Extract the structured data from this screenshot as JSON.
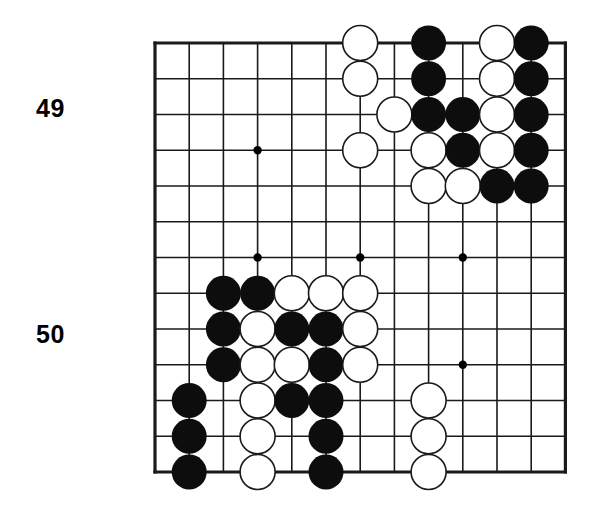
{
  "page": {
    "background_color": "#ffffff",
    "width": 600,
    "height": 515
  },
  "labels": [
    {
      "name": "row-label-49",
      "text": "49",
      "x": 36,
      "y": 96
    },
    {
      "name": "row-label-50",
      "text": "50",
      "x": 36,
      "y": 322
    }
  ],
  "board": {
    "name": "go-board",
    "origin_x": 155,
    "origin_y": 43,
    "cols": 13,
    "rows": 13,
    "col_spacing": 34.2,
    "row_spacing": 35.75,
    "line_color": "#1a1a1a",
    "line_width": 1.6,
    "border_width": 3.2,
    "star_color": "#000000",
    "star_radius": 4.2,
    "star_points": [
      {
        "col": 3,
        "row": 3
      },
      {
        "col": 3,
        "row": 6
      },
      {
        "col": 6,
        "row": 6
      },
      {
        "col": 9,
        "row": 6
      },
      {
        "col": 9,
        "row": 9
      }
    ],
    "stone_radius": 17.5,
    "black_color": "#0d0d0d",
    "white_color": "#ffffff",
    "white_edge_color": "#1a1a1a",
    "white_edge_width": 1.6,
    "stones": [
      {
        "col": 6,
        "row": 0,
        "color": "white"
      },
      {
        "col": 8,
        "row": 0,
        "color": "black"
      },
      {
        "col": 10,
        "row": 0,
        "color": "white"
      },
      {
        "col": 11,
        "row": 0,
        "color": "black"
      },
      {
        "col": 6,
        "row": 1,
        "color": "white"
      },
      {
        "col": 8,
        "row": 1,
        "color": "black"
      },
      {
        "col": 10,
        "row": 1,
        "color": "white"
      },
      {
        "col": 11,
        "row": 1,
        "color": "black"
      },
      {
        "col": 7,
        "row": 2,
        "color": "white"
      },
      {
        "col": 8,
        "row": 2,
        "color": "black"
      },
      {
        "col": 9,
        "row": 2,
        "color": "black"
      },
      {
        "col": 10,
        "row": 2,
        "color": "white"
      },
      {
        "col": 11,
        "row": 2,
        "color": "black"
      },
      {
        "col": 6,
        "row": 3,
        "color": "white"
      },
      {
        "col": 8,
        "row": 3,
        "color": "white"
      },
      {
        "col": 9,
        "row": 3,
        "color": "black"
      },
      {
        "col": 10,
        "row": 3,
        "color": "white"
      },
      {
        "col": 11,
        "row": 3,
        "color": "black"
      },
      {
        "col": 8,
        "row": 4,
        "color": "white"
      },
      {
        "col": 9,
        "row": 4,
        "color": "white"
      },
      {
        "col": 10,
        "row": 4,
        "color": "black"
      },
      {
        "col": 11,
        "row": 4,
        "color": "black"
      },
      {
        "col": 2,
        "row": 7,
        "color": "black"
      },
      {
        "col": 3,
        "row": 7,
        "color": "black"
      },
      {
        "col": 4,
        "row": 7,
        "color": "white"
      },
      {
        "col": 5,
        "row": 7,
        "color": "white"
      },
      {
        "col": 6,
        "row": 7,
        "color": "white"
      },
      {
        "col": 2,
        "row": 8,
        "color": "black"
      },
      {
        "col": 3,
        "row": 8,
        "color": "white"
      },
      {
        "col": 4,
        "row": 8,
        "color": "black"
      },
      {
        "col": 5,
        "row": 8,
        "color": "black"
      },
      {
        "col": 6,
        "row": 8,
        "color": "white"
      },
      {
        "col": 2,
        "row": 9,
        "color": "black"
      },
      {
        "col": 3,
        "row": 9,
        "color": "white"
      },
      {
        "col": 4,
        "row": 9,
        "color": "white"
      },
      {
        "col": 5,
        "row": 9,
        "color": "black"
      },
      {
        "col": 6,
        "row": 9,
        "color": "white"
      },
      {
        "col": 1,
        "row": 10,
        "color": "black"
      },
      {
        "col": 3,
        "row": 10,
        "color": "white"
      },
      {
        "col": 4,
        "row": 10,
        "color": "black"
      },
      {
        "col": 5,
        "row": 10,
        "color": "black"
      },
      {
        "col": 8,
        "row": 10,
        "color": "white"
      },
      {
        "col": 1,
        "row": 11,
        "color": "black"
      },
      {
        "col": 3,
        "row": 11,
        "color": "white"
      },
      {
        "col": 5,
        "row": 11,
        "color": "black"
      },
      {
        "col": 8,
        "row": 11,
        "color": "white"
      },
      {
        "col": 1,
        "row": 12,
        "color": "black"
      },
      {
        "col": 3,
        "row": 12,
        "color": "white"
      },
      {
        "col": 5,
        "row": 12,
        "color": "black"
      },
      {
        "col": 8,
        "row": 12,
        "color": "white"
      }
    ]
  }
}
